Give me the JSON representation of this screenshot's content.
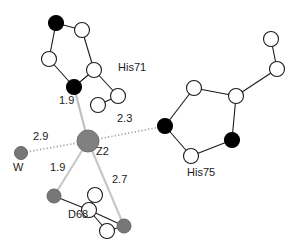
{
  "figure": {
    "type": "molecular-coordination-diagram",
    "center_atom": "Z2",
    "background_color": "#ffffff",
    "colors": {
      "carbon_open": "#ffffff",
      "nitrogen_filled": "#000000",
      "oxygen_water_gray": "#777777",
      "metal_center": "#808080",
      "bond_stroke": "#1a1a1a",
      "coordination_stroke": "#b4b4b4",
      "text": "#1a1a1a"
    }
  },
  "labels": {
    "center": "Z2",
    "water": "W",
    "his71": "His71",
    "his75": "His75",
    "asp68": "D68"
  },
  "distances": {
    "z2_his71": "1.9",
    "z2_his75": "2.3",
    "z2_water": "2.9",
    "z2_d68_od1": "1.9",
    "z2_d68_od2": "2.7"
  },
  "atoms": {
    "metal": {
      "name": "Z2",
      "x": 88,
      "y": 141,
      "r": 11,
      "fill": "#808080"
    },
    "water": {
      "name": "W",
      "x": 21,
      "y": 153,
      "r": 6.5,
      "fill": "#777777"
    },
    "his71_ring": [
      {
        "id": "h71-ne",
        "x": 56,
        "y": 23,
        "r": 7.5,
        "fill": "#000000"
      },
      {
        "id": "h71-ce1",
        "x": 82,
        "y": 30,
        "r": 7.5,
        "fill": "#ffffff"
      },
      {
        "id": "h71-cd2",
        "x": 49,
        "y": 59,
        "r": 7.5,
        "fill": "#ffffff"
      },
      {
        "id": "h71-cg",
        "x": 94,
        "y": 70,
        "r": 7.5,
        "fill": "#ffffff"
      },
      {
        "id": "h71-nd1",
        "x": 74,
        "y": 87,
        "r": 7.5,
        "fill": "#000000"
      }
    ],
    "his71_side": [
      {
        "id": "h71-cb",
        "x": 118,
        "y": 96,
        "r": 7.5,
        "fill": "#ffffff"
      },
      {
        "id": "h71-ca",
        "x": 98,
        "y": 105,
        "r": 7.5,
        "fill": "#ffffff"
      }
    ],
    "his75_ring": [
      {
        "id": "h75-nd1",
        "x": 165,
        "y": 126,
        "r": 7.5,
        "fill": "#000000"
      },
      {
        "id": "h75-cd2",
        "x": 194,
        "y": 88,
        "r": 7.5,
        "fill": "#ffffff"
      },
      {
        "id": "h75-ce1",
        "x": 236,
        "y": 96,
        "r": 7.5,
        "fill": "#ffffff"
      },
      {
        "id": "h75-ne2",
        "x": 232,
        "y": 140,
        "r": 7.5,
        "fill": "#000000"
      },
      {
        "id": "h75-cg",
        "x": 191,
        "y": 156,
        "r": 7.5,
        "fill": "#ffffff"
      }
    ],
    "his75_side": [
      {
        "id": "h75-cb",
        "x": 277,
        "y": 69,
        "r": 7.5,
        "fill": "#ffffff"
      },
      {
        "id": "h75-ca",
        "x": 271,
        "y": 39,
        "r": 7.5,
        "fill": "#ffffff"
      }
    ],
    "asp68": [
      {
        "id": "d68-od1",
        "x": 54,
        "y": 196,
        "r": 7.0,
        "fill": "#777777"
      },
      {
        "id": "d68-cb",
        "x": 95,
        "y": 195,
        "r": 7.5,
        "fill": "#ffffff"
      },
      {
        "id": "d68-cg",
        "x": 89,
        "y": 210,
        "r": 7.5,
        "fill": "#ffffff"
      },
      {
        "id": "d68-ca",
        "x": 107,
        "y": 231,
        "r": 7.5,
        "fill": "#ffffff"
      },
      {
        "id": "d68-od2",
        "x": 124,
        "y": 226,
        "r": 7.0,
        "fill": "#777777"
      }
    ]
  },
  "bonds": [
    {
      "from": "h71-ne",
      "to": "h71-ce1"
    },
    {
      "from": "h71-ne",
      "to": "h71-cd2"
    },
    {
      "from": "h71-ce1",
      "to": "h71-cg"
    },
    {
      "from": "h71-cd2",
      "to": "h71-nd1"
    },
    {
      "from": "h71-cg",
      "to": "h71-nd1"
    },
    {
      "from": "h71-cg",
      "to": "h71-cb"
    },
    {
      "from": "h71-cb",
      "to": "h71-ca"
    },
    {
      "from": "h75-nd1",
      "to": "h75-cd2"
    },
    {
      "from": "h75-cd2",
      "to": "h75-ce1"
    },
    {
      "from": "h75-ce1",
      "to": "h75-ne2"
    },
    {
      "from": "h75-ne2",
      "to": "h75-cg"
    },
    {
      "from": "h75-cg",
      "to": "h75-nd1"
    },
    {
      "from": "h75-ce1",
      "to": "h75-cb"
    },
    {
      "from": "h75-cb",
      "to": "h75-ca"
    },
    {
      "from": "d68-od1",
      "to": "d68-cg"
    },
    {
      "from": "d68-cg",
      "to": "d68-cb"
    },
    {
      "from": "d68-cg",
      "to": "d68-od2"
    },
    {
      "from": "d68-cg",
      "to": "d68-ca"
    },
    {
      "from": "d68-ca",
      "to": "d68-od2"
    }
  ],
  "coordination_bonds": [
    {
      "from": "metal",
      "to": "h71-nd1",
      "label": "1.9",
      "style": "solid-light"
    },
    {
      "from": "metal",
      "to": "h75-nd1",
      "label": "2.3",
      "style": "dotted"
    },
    {
      "from": "metal",
      "to": "water",
      "label": "2.9",
      "style": "dotted"
    },
    {
      "from": "metal",
      "to": "d68-od1",
      "label": "1.9",
      "style": "solid-light"
    },
    {
      "from": "metal",
      "to": "d68-od2",
      "label": "2.7",
      "style": "solid-light"
    }
  ],
  "text_positions": {
    "his71": {
      "x": 118,
      "y": 66
    },
    "his75": {
      "x": 187,
      "y": 172
    },
    "asp68": {
      "x": 68,
      "y": 214
    },
    "center": {
      "x": 96,
      "y": 150
    },
    "water": {
      "x": 13,
      "y": 167
    },
    "d_1_9_top": {
      "x": 59,
      "y": 100
    },
    "d_2_3": {
      "x": 117,
      "y": 118
    },
    "d_2_9": {
      "x": 33,
      "y": 136
    },
    "d_1_9_bottom": {
      "x": 50,
      "y": 167
    },
    "d_2_7": {
      "x": 112,
      "y": 179
    }
  }
}
